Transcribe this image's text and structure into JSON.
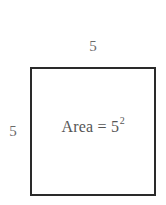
{
  "figure": {
    "type": "geometry-diagram",
    "shape": "square",
    "background_color": "#ffffff",
    "border_color": "#2a2a2a",
    "text_color": "#565656",
    "label_color": "#6a6a6a",
    "top_dimension": "5",
    "left_dimension": "5",
    "area_expression": {
      "full": "Area = 5²",
      "base": "Area = 5",
      "exponent": "2"
    }
  }
}
